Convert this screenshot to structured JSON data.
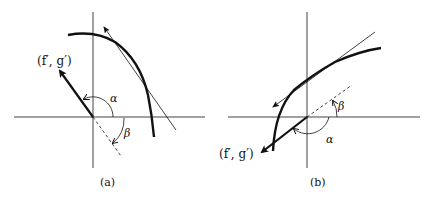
{
  "figure": {
    "panels": [
      {
        "id": "a",
        "caption": "(a)",
        "vector_label": "(f′, g′)",
        "angle_alpha": "α",
        "angle_beta": "β"
      },
      {
        "id": "b",
        "caption": "(b)",
        "vector_label": "(f′, g′)",
        "angle_alpha": "α",
        "angle_beta": "β"
      }
    ],
    "colors": {
      "ink": "#111111",
      "background": "#ffffff"
    }
  }
}
